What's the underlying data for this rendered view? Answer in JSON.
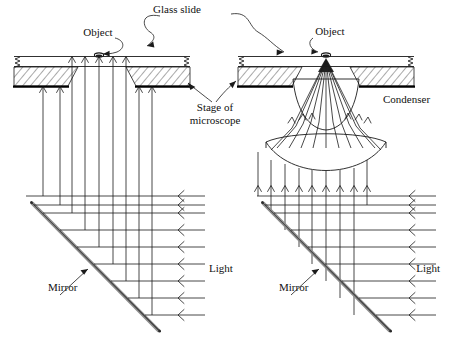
{
  "figure": {
    "kind": "optics-diagram",
    "title_visible": false
  },
  "labels": {
    "glass_slide": "Glass slide",
    "object_left": "Object",
    "object_right": "Object",
    "stage_of_microscope_line1": "Stage of",
    "stage_of_microscope_line2": "microscope",
    "condenser": "Condenser",
    "mirror_left": "Mirror",
    "mirror_right": "Mirror",
    "light_left": "Light",
    "light_right": "Light"
  },
  "colors": {
    "ink": "#1a1a1a",
    "background": "#ffffff",
    "mirror_body": "#8c8c8c",
    "stage_edge": "#000000"
  },
  "diagram_data": {
    "type": "ray-diagram",
    "panels": [
      {
        "name": "left-panel-no-condenser",
        "incoming_light_rays": 9,
        "reflected_vertical_rays": 9,
        "rays_through_aperture": 5,
        "rays_into_stage_underside": 4,
        "mirror_angle_deg": 45,
        "has_condenser": false,
        "illumination": "parallel rays reach object directly"
      },
      {
        "name": "right-panel-with-condenser",
        "incoming_light_rays": 9,
        "reflected_vertical_rays": 9,
        "condenser_lens_elements": 2,
        "rays_converging_to_object": 11,
        "mirror_angle_deg": 45,
        "has_condenser": true,
        "illumination": "rays converge through condenser onto object"
      }
    ],
    "components": [
      "glass slide",
      "object",
      "stage of microscope",
      "condenser",
      "mirror",
      "light"
    ]
  }
}
